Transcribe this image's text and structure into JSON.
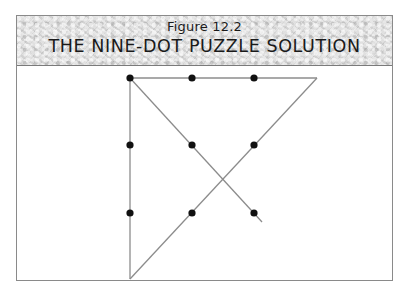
{
  "figure": {
    "number_label": "Figure 12.2",
    "title": "THE NINE-DOT PUZZLE SOLUTION"
  },
  "colors": {
    "dot": "#111111",
    "line": "#8c8c8c",
    "frame": "#8a8a8a",
    "header_bg": "#d9d9d9"
  },
  "diagram": {
    "dots": [
      {
        "row": 1,
        "col": 1,
        "x": 130,
        "y": 78
      },
      {
        "row": 1,
        "col": 2,
        "x": 192,
        "y": 78
      },
      {
        "row": 1,
        "col": 3,
        "x": 254,
        "y": 78
      },
      {
        "row": 2,
        "col": 1,
        "x": 130,
        "y": 145
      },
      {
        "row": 2,
        "col": 2,
        "x": 192,
        "y": 145
      },
      {
        "row": 2,
        "col": 3,
        "x": 254,
        "y": 145
      },
      {
        "row": 3,
        "col": 1,
        "x": 130,
        "y": 213
      },
      {
        "row": 3,
        "col": 2,
        "x": 192,
        "y": 213
      },
      {
        "row": 3,
        "col": 3,
        "x": 254,
        "y": 213
      }
    ],
    "solution_path": [
      {
        "x": 262,
        "y": 222
      },
      {
        "x": 130,
        "y": 78
      },
      {
        "x": 317,
        "y": 78
      },
      {
        "x": 130,
        "y": 279
      },
      {
        "x": 130,
        "y": 78
      }
    ]
  }
}
